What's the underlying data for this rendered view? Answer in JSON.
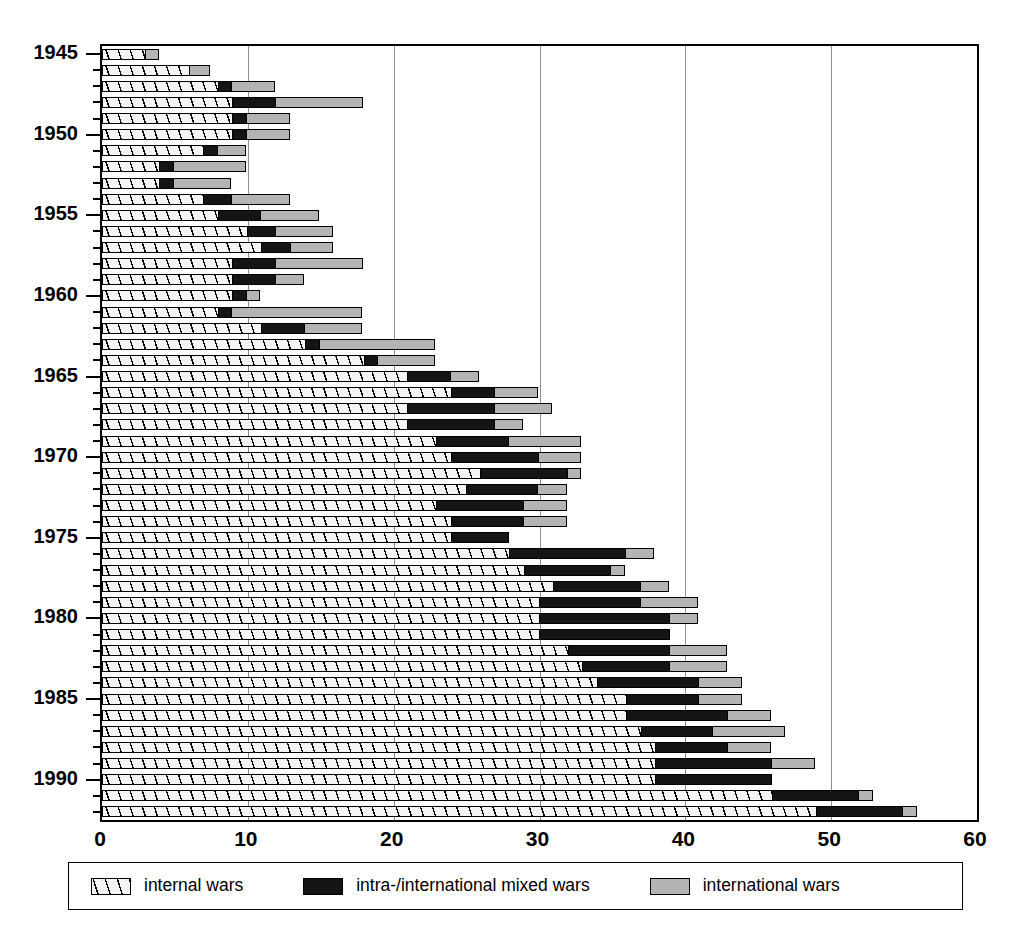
{
  "chart_data": {
    "type": "bar",
    "orientation": "horizontal",
    "stacked": true,
    "title": "",
    "xlabel": "",
    "ylabel": "",
    "xlim": [
      0,
      60
    ],
    "xticks": [
      0,
      10,
      20,
      30,
      40,
      50,
      60
    ],
    "xtick_labels": [
      "0",
      "10",
      "20",
      "30",
      "40",
      "50",
      "60"
    ],
    "grid": "vertical",
    "ytick_labels": [
      "1945",
      "1950",
      "1955",
      "1960",
      "1965",
      "1970",
      "1975",
      "1980",
      "1985",
      "1990"
    ],
    "ytick_years": [
      1945,
      1950,
      1955,
      1960,
      1965,
      1970,
      1975,
      1980,
      1985,
      1990
    ],
    "legend_position": "below",
    "series": [
      {
        "name": "internal wars",
        "key": "internal",
        "color": "#f4f4f4",
        "pattern": "diagonal-hatch",
        "values": [
          3,
          6,
          8,
          9,
          9,
          9,
          7,
          4,
          4,
          7,
          8,
          10,
          11,
          9,
          9,
          9,
          8,
          11,
          14,
          18,
          21,
          24,
          21,
          21,
          23,
          24,
          26,
          25,
          23,
          24,
          24,
          28,
          29,
          31,
          30,
          30,
          30,
          32,
          33,
          34,
          36,
          36,
          37,
          38,
          38,
          38,
          46,
          49
        ]
      },
      {
        "name": "intra-/international mixed wars",
        "key": "mixed",
        "color": "#141414",
        "pattern": "solid-black",
        "values": [
          0,
          0,
          1,
          3,
          1,
          1,
          1,
          1,
          1,
          2,
          3,
          2,
          2,
          3,
          3,
          1,
          1,
          3,
          1,
          1,
          3,
          3,
          6,
          6,
          5,
          6,
          6,
          5,
          6,
          5,
          4,
          8,
          6,
          6,
          7,
          9,
          9,
          7,
          6,
          7,
          5,
          7,
          5,
          5,
          8,
          8,
          6,
          6
        ]
      },
      {
        "name": "international wars",
        "key": "international",
        "color": "#b4b4b4",
        "pattern": "solid-gray",
        "values": [
          1,
          1.5,
          3,
          6,
          3,
          3,
          2,
          5,
          4,
          4,
          4,
          4,
          3,
          6,
          2,
          1,
          9,
          4,
          8,
          4,
          2,
          3,
          4,
          2,
          5,
          3,
          1,
          2,
          3,
          3,
          0,
          2,
          1,
          2,
          4,
          2,
          0,
          4,
          4,
          3,
          3,
          3,
          5,
          3,
          3,
          0,
          1,
          1
        ]
      }
    ],
    "years": [
      1945,
      1946,
      1947,
      1948,
      1949,
      1950,
      1951,
      1952,
      1953,
      1954,
      1955,
      1956,
      1957,
      1958,
      1959,
      1960,
      1961,
      1962,
      1963,
      1964,
      1965,
      1966,
      1967,
      1968,
      1969,
      1970,
      1971,
      1972,
      1973,
      1974,
      1975,
      1976,
      1977,
      1978,
      1979,
      1980,
      1981,
      1982,
      1983,
      1984,
      1985,
      1986,
      1987,
      1988,
      1989,
      1990,
      1991,
      1992
    ],
    "totals": [
      4,
      7.5,
      12,
      18,
      13,
      13,
      10,
      10,
      9,
      13,
      15,
      16,
      16,
      18,
      14,
      11,
      18,
      18,
      23,
      23,
      26,
      30,
      31,
      29,
      33,
      33,
      33,
      32,
      32,
      32,
      28,
      38,
      36,
      39,
      41,
      41,
      39,
      43,
      43,
      44,
      44,
      46,
      47,
      46,
      49,
      46,
      53,
      56
    ]
  },
  "legend": {
    "items": [
      {
        "label": "internal wars",
        "swatch": "hatched-swatch"
      },
      {
        "label": "intra-/international mixed wars",
        "swatch": "black-swatch"
      },
      {
        "label": "international wars",
        "swatch": "gray-swatch"
      }
    ]
  },
  "axes": {
    "x_labels": [
      "0",
      "10",
      "20",
      "30",
      "40",
      "50",
      "60"
    ],
    "y_labels": [
      "1945",
      "1950",
      "1955",
      "1960",
      "1965",
      "1970",
      "1975",
      "1980",
      "1985",
      "1990"
    ]
  }
}
